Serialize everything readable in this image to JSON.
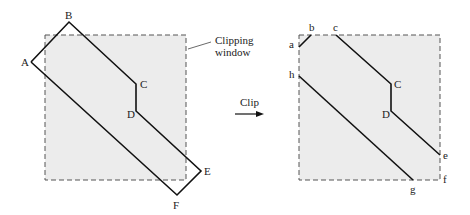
{
  "figure": {
    "before": {
      "window_label_line1": "Clipping",
      "window_label_line2": "window",
      "vertices": {
        "A": "A",
        "B": "B",
        "C": "C",
        "D": "D",
        "E": "E",
        "F": "F"
      }
    },
    "operation": {
      "label": "Clip"
    },
    "after": {
      "vertices": {
        "a": "a",
        "b": "b",
        "c": "c",
        "C": "C",
        "D": "D",
        "e": "e",
        "f": "f",
        "g": "g",
        "h": "h"
      }
    }
  },
  "colors": {
    "window_fill": "#ececec",
    "window_border": "#555555",
    "polygon_stroke": "#111111"
  }
}
